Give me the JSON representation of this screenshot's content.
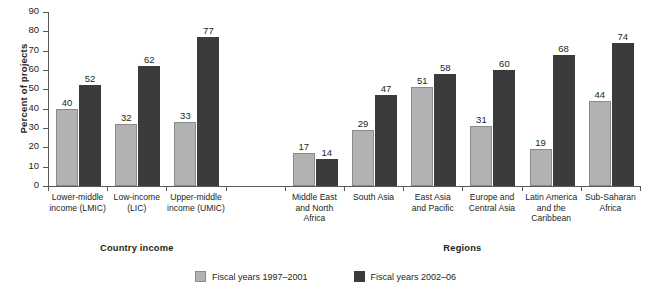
{
  "chart_data": {
    "type": "bar",
    "title": "",
    "xlabel": "",
    "ylabel": "Percent of projects",
    "ylim": [
      0,
      90
    ],
    "yticks": [
      0,
      10,
      20,
      30,
      40,
      50,
      60,
      70,
      80,
      90
    ],
    "grid": false,
    "legend_position": "bottom-center",
    "categories": [
      "Lower-middle income (LMIC)",
      "Low-income (LIC)",
      "Upper-middle income (UMIC)",
      "Middle East and North Africa",
      "South Asia",
      "East Asia and Pacific",
      "Europe and Central Asia",
      "Latin America and the Caribbean",
      "Sub-Saharan Africa"
    ],
    "series": [
      {
        "name": "Fiscal years 1997–2001",
        "color": "#b2b2b2",
        "values": [
          40,
          32,
          33,
          17,
          29,
          51,
          31,
          19,
          44
        ]
      },
      {
        "name": "Fiscal years 2002–06",
        "color": "#3b3b3b",
        "values": [
          52,
          62,
          77,
          14,
          47,
          58,
          60,
          68,
          74
        ]
      }
    ],
    "category_lines": [
      [
        "Lower-middle",
        "income (LMIC)"
      ],
      [
        "Low-income",
        "(LIC)"
      ],
      [
        "Upper-middle",
        "income (UMIC)"
      ],
      [
        "Middle East",
        "and North",
        "Africa"
      ],
      [
        "South Asia"
      ],
      [
        "East Asia",
        "and Pacific"
      ],
      [
        "Europe and",
        "Central Asia"
      ],
      [
        "Latin America",
        "and the",
        "Caribbean"
      ],
      [
        "Sub-Saharan",
        "Africa"
      ]
    ],
    "sections": [
      {
        "label": "Country income",
        "slots": [
          0,
          1,
          2
        ]
      },
      {
        "label": "Regions",
        "slots": [
          4,
          5,
          6,
          7,
          8,
          9
        ]
      }
    ],
    "slot_map": [
      0,
      1,
      2,
      4,
      5,
      6,
      7,
      8,
      9
    ],
    "slot_count": 10
  }
}
